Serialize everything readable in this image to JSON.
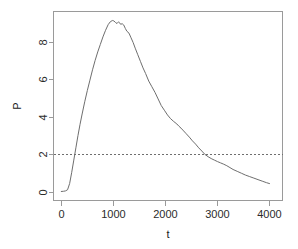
{
  "chart_data": {
    "type": "line",
    "title": "",
    "xlabel": "t",
    "ylabel": "P",
    "xlim": [
      -150,
      4250
    ],
    "ylim": [
      -0.45,
      9.6
    ],
    "xticks": [
      0,
      1000,
      2000,
      3000,
      4000
    ],
    "xtick_labels": [
      "0",
      "1000",
      "2000",
      "3000",
      "4000"
    ],
    "yticks": [
      0,
      2,
      4,
      6,
      8
    ],
    "ytick_labels": [
      "0",
      "2",
      "4",
      "6",
      "8"
    ],
    "grid": false,
    "legend": null,
    "box": true,
    "annotations": [
      {
        "kind": "hline",
        "name": "threshold-line",
        "y": 2,
        "style": "dashed",
        "color": "#6e6e6e"
      }
    ],
    "series": [
      {
        "name": "P",
        "color": "#6e6e6e",
        "style": "solid",
        "x": [
          0,
          40,
          80,
          120,
          160,
          200,
          240,
          280,
          320,
          360,
          400,
          450,
          500,
          550,
          600,
          650,
          700,
          750,
          800,
          850,
          900,
          940,
          980,
          1010,
          1040,
          1070,
          1100,
          1120,
          1140,
          1170,
          1200,
          1230,
          1260,
          1300,
          1340,
          1380,
          1420,
          1470,
          1520,
          1570,
          1620,
          1680,
          1740,
          1800,
          1860,
          1920,
          1980,
          2040,
          2100,
          2160,
          2220,
          2260,
          2300,
          2350,
          2400,
          2460,
          2520,
          2580,
          2640,
          2700,
          2760,
          2820,
          2880,
          2940,
          3000,
          3060,
          3120,
          3180,
          3240,
          3300,
          3380,
          3460,
          3540,
          3620,
          3700,
          3780,
          3860,
          3940,
          4000
        ],
        "y": [
          0.03,
          0.04,
          0.06,
          0.12,
          0.45,
          1.05,
          1.7,
          2.35,
          3.0,
          3.6,
          4.15,
          4.8,
          5.4,
          5.95,
          6.5,
          7.0,
          7.45,
          7.85,
          8.25,
          8.6,
          8.9,
          9.05,
          9.12,
          9.1,
          9.02,
          8.96,
          9.05,
          9.0,
          8.92,
          8.95,
          8.88,
          8.7,
          8.55,
          8.45,
          8.2,
          7.95,
          7.65,
          7.3,
          6.95,
          6.6,
          6.3,
          5.9,
          5.6,
          5.3,
          4.95,
          4.6,
          4.35,
          4.1,
          3.9,
          3.75,
          3.62,
          3.5,
          3.4,
          3.25,
          3.1,
          2.92,
          2.72,
          2.55,
          2.35,
          2.18,
          2.0,
          1.88,
          1.78,
          1.7,
          1.62,
          1.55,
          1.48,
          1.4,
          1.3,
          1.2,
          1.1,
          1.0,
          0.9,
          0.82,
          0.74,
          0.66,
          0.58,
          0.5,
          0.45
        ]
      }
    ]
  }
}
